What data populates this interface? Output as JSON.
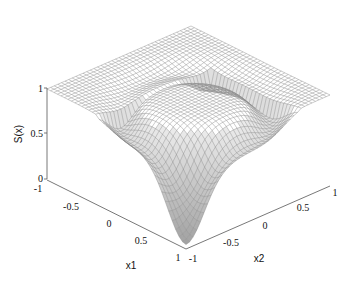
{
  "chart_data": {
    "type": "surface3d",
    "title": "",
    "xlabel": "x1",
    "ylabel": "x2",
    "zlabel": "S(x)",
    "x_ticks": [
      "-1",
      "-0.5",
      "0",
      "0.5",
      "1"
    ],
    "y_ticks": [
      "-1",
      "-0.5",
      "0",
      "0.5",
      "1"
    ],
    "z_ticks": [
      "0",
      "0.5",
      "1"
    ],
    "xlim": [
      -1,
      1
    ],
    "ylim": [
      -1,
      1
    ],
    "zlim": [
      0,
      1
    ],
    "grid": false,
    "legend": null,
    "surface_color": "#888888",
    "trough_color": "#333333"
  }
}
